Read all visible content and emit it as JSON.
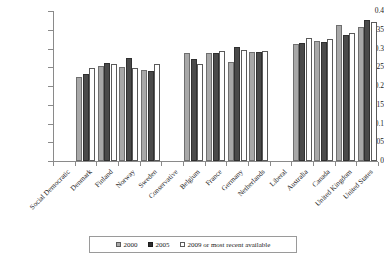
{
  "chart_data": {
    "type": "bar",
    "title": "",
    "subtitle": "",
    "xlabel": "",
    "ylabel": "",
    "ylim": [
      0,
      0.4
    ],
    "grid": false,
    "legend_position": "bottom",
    "y_ticks": [
      "0",
      "0.05",
      "0.1",
      "0.15",
      "0.2",
      "0.25",
      "0.3",
      "0.35",
      "0.4"
    ],
    "y_tick_values": [
      0,
      0.05,
      0.1,
      0.15,
      0.2,
      0.25,
      0.3,
      0.35,
      0.4
    ],
    "categories": [
      "Social Democratic",
      "Denmark",
      "Finland",
      "Norway",
      "Sweden",
      "Conservative",
      "Belgium",
      "France",
      "Germany",
      "Netherlands",
      "Liberal",
      "Australia",
      "Canada",
      "United Kingdom",
      "United States"
    ],
    "group_headers": [
      "Social Democratic",
      "Conservative",
      "Liberal"
    ],
    "series": [
      {
        "name": "2000",
        "color": "#a8a8a8",
        "values": [
          null,
          0.225,
          0.254,
          0.251,
          0.244,
          null,
          0.289,
          0.288,
          0.264,
          0.292,
          null,
          0.313,
          0.32,
          0.363,
          0.357
        ]
      },
      {
        "name": "2005",
        "color": "#4a4a4a",
        "values": [
          null,
          0.232,
          0.262,
          0.275,
          0.241,
          null,
          0.271,
          0.288,
          0.303,
          0.29,
          null,
          0.316,
          0.317,
          0.335,
          0.376
        ]
      },
      {
        "name": "2009 or most recent available",
        "color": "#ffffff",
        "values": [
          null,
          0.248,
          0.258,
          0.247,
          0.26,
          null,
          0.259,
          0.293,
          0.295,
          0.294,
          null,
          0.327,
          0.325,
          0.341,
          0.372
        ]
      }
    ]
  },
  "legend": {
    "entries": [
      {
        "label": "2000",
        "swatch": "legend-swatch-2000"
      },
      {
        "label": "2005",
        "swatch": "legend-swatch-2005"
      },
      {
        "label": "2009 or most recent available",
        "swatch": "legend-swatch-2009"
      }
    ]
  }
}
